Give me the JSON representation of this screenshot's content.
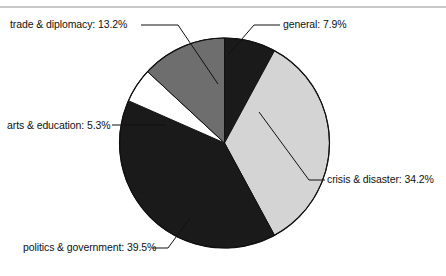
{
  "figure": {
    "background_color": "#ffffff",
    "rule_color": "#c9c9c9",
    "outline_color": "#111111"
  },
  "chart_data": {
    "type": "pie",
    "title": "",
    "subtitle": "",
    "xlabel": "",
    "ylabel": "",
    "legend_position": "none",
    "grid": false,
    "start_angle_deg": 0,
    "direction": "clockwise",
    "center": {
      "x": 224.5,
      "y": 143
    },
    "radius": 105,
    "categories": [
      "general",
      "crisis & disaster",
      "politics & government",
      "arts & education",
      "trade & diplomacy"
    ],
    "values": [
      7.9,
      34.2,
      39.5,
      5.3,
      13.2
    ],
    "value_unit": "%",
    "colors": [
      "#1a1a1a",
      "#d4d4d4",
      "#1a1a1a",
      "#ffffff",
      "#6e6e6e"
    ],
    "slices": [
      {
        "label": "general",
        "value": 7.9,
        "display": "general: 7.9%",
        "color": "#1a1a1a",
        "start_deg": 0.0,
        "end_deg": 28.44
      },
      {
        "label": "crisis & disaster",
        "value": 34.2,
        "display": "crisis & disaster: 34.2%",
        "color": "#d4d4d4",
        "start_deg": 28.44,
        "end_deg": 151.56
      },
      {
        "label": "politics & government",
        "value": 39.5,
        "display": "politics & government: 39.5%",
        "color": "#1a1a1a",
        "start_deg": 151.56,
        "end_deg": 293.76
      },
      {
        "label": "arts & education",
        "value": 5.3,
        "display": "arts & education: 5.3%",
        "color": "#ffffff",
        "start_deg": 293.76,
        "end_deg": 312.84
      },
      {
        "label": "trade & diplomacy",
        "value": 13.2,
        "display": "trade & diplomacy: 13.2%",
        "color": "#6e6e6e",
        "start_deg": 312.84,
        "end_deg": 360.0
      }
    ]
  },
  "labels": {
    "trade": "trade & diplomacy: 13.2%",
    "general": "general: 7.9%",
    "arts": "arts & education: 5.3%",
    "crisis": "crisis & disaster: 34.2%",
    "politics": "politics & government: 39.5%"
  }
}
